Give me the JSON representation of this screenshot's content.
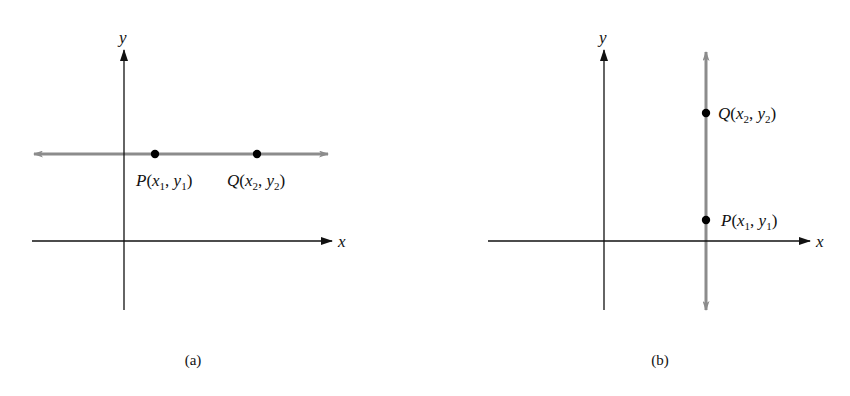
{
  "figure": {
    "panels": [
      {
        "id": "a",
        "caption": "(a)",
        "axes": {
          "x_label": "x",
          "y_label": "y"
        },
        "line": {
          "orientation": "horizontal",
          "color": "#8c8c8c"
        },
        "points": [
          {
            "name": "P",
            "x_sub": "1",
            "y_sub": "1",
            "label": "P(x1, y1)"
          },
          {
            "name": "Q",
            "x_sub": "2",
            "y_sub": "2",
            "label": "Q(x2, y2)"
          }
        ]
      },
      {
        "id": "b",
        "caption": "(b)",
        "axes": {
          "x_label": "x",
          "y_label": "y"
        },
        "line": {
          "orientation": "vertical",
          "color": "#8c8c8c"
        },
        "points": [
          {
            "name": "Q",
            "x_sub": "2",
            "y_sub": "2",
            "label": "Q(x2, y2)"
          },
          {
            "name": "P",
            "x_sub": "1",
            "y_sub": "1",
            "label": "P(x1, y1)"
          }
        ]
      }
    ],
    "colors": {
      "axis": "#111111",
      "line": "#8c8c8c",
      "point": "#000000"
    },
    "text": {
      "x_var": "x",
      "y_var": "y",
      "open": "(",
      "comma": ", ",
      "close": ")"
    }
  }
}
